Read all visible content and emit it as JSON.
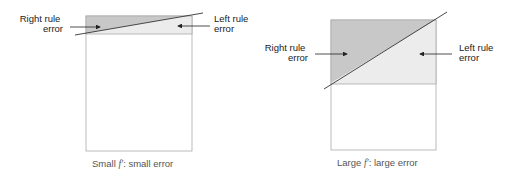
{
  "left_panel": {
    "label_right_rule": [
      "Right rule",
      "error"
    ],
    "label_left_rule": [
      "Left rule",
      "error"
    ],
    "caption_prefix": "Small ",
    "caption_symbol": "f′",
    "caption_suffix": ": small error"
  },
  "right_panel": {
    "label_right_rule": [
      "Right rule",
      "error"
    ],
    "label_left_rule": [
      "Left rule",
      "error"
    ],
    "caption_prefix": "Large ",
    "caption_symbol": "f′",
    "caption_suffix": ": large error"
  },
  "colors": {
    "dark_shade": "#c8c8c8",
    "light_shade": "#ececec",
    "outline": "#aaaaaa",
    "line": "#333333"
  }
}
